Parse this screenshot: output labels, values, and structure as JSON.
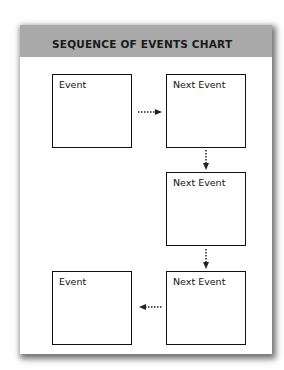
{
  "chart": {
    "title": "SEQUENCE OF EVENTS CHART",
    "boxes": [
      {
        "label": "Event"
      },
      {
        "label": "Next Event"
      },
      {
        "label": "Next Event"
      },
      {
        "label": "Next Event"
      },
      {
        "label": "Event"
      }
    ],
    "arrows": [
      {
        "from": 0,
        "to": 1,
        "direction": "right"
      },
      {
        "from": 1,
        "to": 2,
        "direction": "down"
      },
      {
        "from": 2,
        "to": 3,
        "direction": "down"
      },
      {
        "from": 3,
        "to": 4,
        "direction": "left"
      }
    ],
    "colors": {
      "header": "#a9a9a9",
      "border": "#111111",
      "background": "#ffffff"
    }
  }
}
